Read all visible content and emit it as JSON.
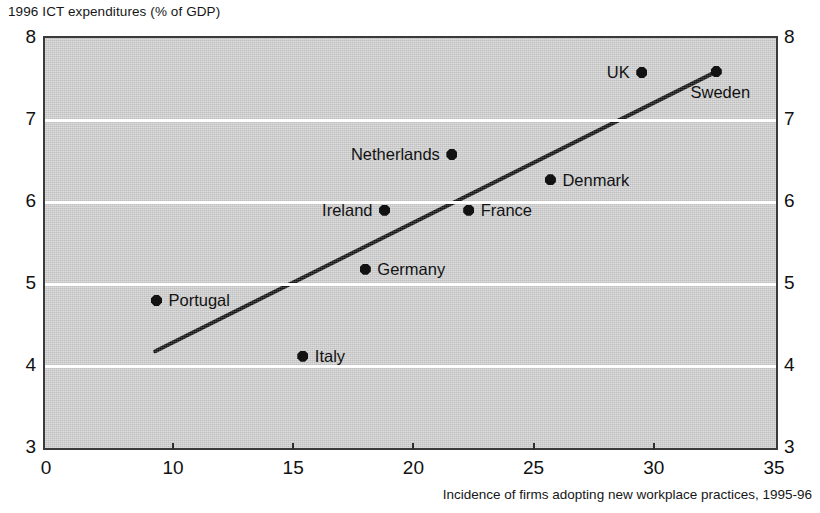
{
  "chart_data": {
    "type": "scatter",
    "title": "1996 ICT expenditures (% of GDP)",
    "ylabel": "1996 ICT expenditures (% of GDP)",
    "xlabel": "Incidence of firms adopting new workplace practices, 1995-96",
    "xlim": [
      0,
      35
    ],
    "ylim": [
      3,
      8
    ],
    "x_ticks": [
      0,
      10,
      15,
      20,
      25,
      30,
      35
    ],
    "x_tick_labels": [
      "0",
      "10",
      "15",
      "20",
      "25",
      "30",
      "35"
    ],
    "y_ticks": [
      3,
      4,
      5,
      6,
      7,
      8
    ],
    "y_tick_labels": [
      "3",
      "4",
      "5",
      "6",
      "7",
      "8"
    ],
    "y_axis_right_labels": [
      "3",
      "4",
      "5",
      "6",
      "7",
      "8"
    ],
    "grid": "horizontal-white",
    "legend": "none",
    "plot_background": "#d2d2d2",
    "marker_color": "#121212",
    "trend_line_color": "#121212",
    "axis_break_note": "x-axis compressed between 0 and 10",
    "points": [
      {
        "label": "Portugal",
        "x": 8.7,
        "y": 4.8,
        "label_side": "right"
      },
      {
        "label": "Italy",
        "x": 15.4,
        "y": 4.12,
        "label_side": "right"
      },
      {
        "label": "Germany",
        "x": 18.0,
        "y": 5.18,
        "label_side": "right"
      },
      {
        "label": "Ireland",
        "x": 18.8,
        "y": 5.9,
        "label_side": "left"
      },
      {
        "label": "Netherlands",
        "x": 21.6,
        "y": 6.58,
        "label_side": "left"
      },
      {
        "label": "France",
        "x": 22.3,
        "y": 5.9,
        "label_side": "right"
      },
      {
        "label": "Denmark",
        "x": 25.7,
        "y": 6.27,
        "label_side": "right"
      },
      {
        "label": "UK",
        "x": 29.5,
        "y": 7.58,
        "label_side": "left"
      },
      {
        "label": "Sweden",
        "x": 32.6,
        "y": 7.59,
        "label_side": "below"
      }
    ],
    "trend_line": {
      "x_start": 8.6,
      "y_start": 4.18,
      "x_end": 32.6,
      "y_end": 7.59
    }
  }
}
